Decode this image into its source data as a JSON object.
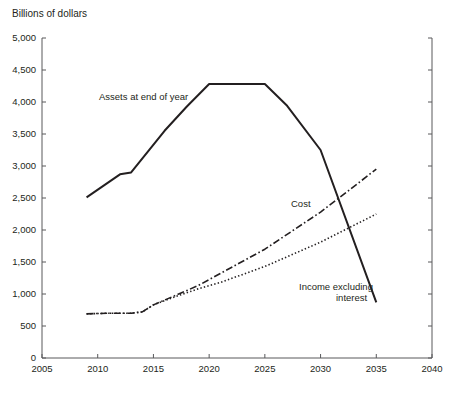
{
  "chart_data": {
    "type": "line",
    "title": "",
    "ylabel": "Billions of dollars",
    "xlabel": "",
    "xlim": [
      2005,
      2040
    ],
    "ylim": [
      0,
      5000
    ],
    "grid": false,
    "legend": "inline-annotations",
    "y_ticks": [
      "0",
      "500",
      "1,000",
      "1,500",
      "2,000",
      "2,500",
      "3,000",
      "3,500",
      "4,000",
      "4,500",
      "5,000"
    ],
    "y_tick_values": [
      0,
      500,
      1000,
      1500,
      2000,
      2500,
      3000,
      3500,
      4000,
      4500,
      5000
    ],
    "x_ticks": [
      "2005",
      "2010",
      "2015",
      "2020",
      "2025",
      "2030",
      "2035",
      "2040"
    ],
    "x_tick_values": [
      2005,
      2010,
      2015,
      2020,
      2025,
      2030,
      2035,
      2040
    ],
    "series": [
      {
        "name": "Assets at end of year",
        "style": "solid",
        "x": [
          2009,
          2012,
          2013,
          2016,
          2018,
          2020,
          2025,
          2027,
          2030,
          2035
        ],
        "values": [
          2510,
          2870,
          2900,
          3550,
          3930,
          4280,
          4280,
          3940,
          3250,
          870
        ]
      },
      {
        "name": "Cost",
        "style": "dash-dot",
        "x": [
          2009,
          2011,
          2013,
          2014,
          2015,
          2017,
          2019,
          2021,
          2025,
          2030,
          2035
        ],
        "values": [
          690,
          700,
          700,
          720,
          830,
          980,
          1130,
          1320,
          1700,
          2280,
          2950
        ]
      },
      {
        "name": "Income excluding interest",
        "style": "dotted",
        "x": [
          2009,
          2011,
          2013,
          2014,
          2015,
          2017,
          2019,
          2021,
          2025,
          2030,
          2035
        ],
        "values": [
          690,
          700,
          700,
          720,
          830,
          960,
          1080,
          1180,
          1430,
          1810,
          2250
        ]
      }
    ],
    "annotations": [
      {
        "text": "Assets at end of year",
        "series": "Assets at end of year",
        "x_px": 99,
        "y_px": 100,
        "align": "start"
      },
      {
        "text": "Cost",
        "series": "Cost",
        "x_px": 291,
        "y_px": 207,
        "align": "start"
      },
      {
        "text": "Income excluding",
        "series": "Income excluding interest",
        "x_px": 299,
        "y_px": 290,
        "align": "start"
      },
      {
        "text": "interest",
        "series": "Income excluding interest",
        "x_px": 336,
        "y_px": 301,
        "align": "start"
      }
    ]
  },
  "colors": {
    "ink": "#231f20",
    "axis": "#58595b",
    "background": "#ffffff"
  }
}
